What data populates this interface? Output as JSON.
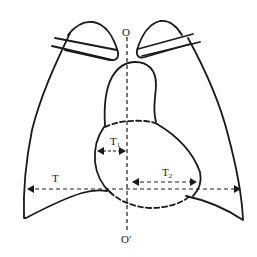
{
  "diagram": {
    "labels": {
      "top_axis": "O",
      "bottom_axis": "O′",
      "thoracic_width": "T",
      "left_heart_width": "T",
      "left_heart_width_sub": "1",
      "right_heart_width": "T",
      "right_heart_width_sub": "2"
    },
    "colors": {
      "stroke": "#1a1a1a",
      "background": "#ffffff"
    }
  }
}
